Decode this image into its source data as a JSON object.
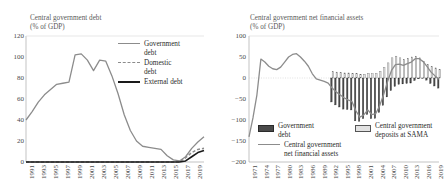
{
  "figure": {
    "panels": [
      "left",
      "right"
    ]
  },
  "chart_data": [
    {
      "id": "central-government-debt",
      "type": "line",
      "title": "Central government debt",
      "subtitle": "(% of GDP)",
      "xlabel": "",
      "ylabel": "",
      "ylim": [
        0,
        120
      ],
      "yticks": [
        0,
        20,
        40,
        60,
        80,
        100,
        120
      ],
      "xlim": [
        1990,
        2019
      ],
      "xticks": [
        1991,
        1993,
        1995,
        1997,
        1999,
        2001,
        2003,
        2005,
        2007,
        2009,
        2011,
        2013,
        2015,
        2017,
        2019
      ],
      "grid": false,
      "legend_position": "top-right",
      "x": [
        1990,
        1991,
        1992,
        1993,
        1994,
        1995,
        1996,
        1997,
        1998,
        1999,
        2000,
        2001,
        2002,
        2003,
        2004,
        2005,
        2006,
        2007,
        2008,
        2009,
        2010,
        2011,
        2012,
        2013,
        2014,
        2015,
        2016,
        2017,
        2018,
        2019
      ],
      "series": [
        {
          "name": "Government debt",
          "style": "solid",
          "color": "#8c8c8c",
          "values": [
            40,
            48,
            57,
            64,
            69,
            74,
            75,
            76,
            102,
            103,
            97,
            87,
            97,
            96,
            82,
            65,
            45,
            30,
            20,
            15,
            14,
            13,
            12,
            6,
            2,
            1,
            5,
            13,
            19,
            24
          ]
        },
        {
          "name": "Domestic debt",
          "style": "dashed",
          "color": "#8c8c8c",
          "values": [
            0,
            0,
            0,
            0,
            0,
            0,
            0,
            0,
            0,
            0,
            0,
            0,
            0,
            0,
            0,
            0,
            0,
            0,
            0,
            0,
            0,
            0,
            0,
            0,
            0,
            0,
            4,
            9,
            12,
            13
          ]
        },
        {
          "name": "External debt",
          "style": "solid",
          "color": "#1a1a1a",
          "values": [
            0,
            0,
            0,
            0,
            0,
            0,
            0,
            0,
            0,
            0,
            0,
            0,
            0,
            0,
            0,
            0,
            0,
            0,
            0,
            0,
            0,
            0,
            0,
            0,
            0,
            0,
            1,
            5,
            9,
            11
          ]
        }
      ]
    },
    {
      "id": "central-government-net-financial-assets",
      "type": "bar",
      "title": "Central government net financial assets",
      "subtitle": "(% of GDP)",
      "xlabel": "",
      "ylabel": "",
      "ylim": [
        -200,
        100
      ],
      "yticks": [
        100,
        50,
        0,
        -50,
        -100,
        -150,
        -200
      ],
      "xlim": [
        1971,
        2019
      ],
      "xticks": [
        1971,
        1974,
        1977,
        1980,
        1983,
        1986,
        1989,
        1992,
        1995,
        1998,
        2001,
        2004,
        2007,
        2010,
        2013,
        2016,
        2019
      ],
      "grid": false,
      "legend_position": "bottom",
      "x": [
        1971,
        1972,
        1973,
        1974,
        1975,
        1976,
        1977,
        1978,
        1979,
        1980,
        1981,
        1982,
        1983,
        1984,
        1985,
        1986,
        1987,
        1988,
        1989,
        1990,
        1991,
        1992,
        1993,
        1994,
        1995,
        1996,
        1997,
        1998,
        1999,
        2000,
        2001,
        2002,
        2003,
        2004,
        2005,
        2006,
        2007,
        2008,
        2009,
        2010,
        2011,
        2012,
        2013,
        2014,
        2015,
        2016,
        2017,
        2018,
        2019
      ],
      "series": [
        {
          "name": "Government debt",
          "kind": "bar",
          "color": "#4a4a4a",
          "values": [
            0,
            0,
            0,
            0,
            0,
            0,
            0,
            0,
            0,
            0,
            0,
            0,
            0,
            0,
            0,
            0,
            0,
            0,
            0,
            0,
            0,
            -57,
            -64,
            -69,
            -74,
            -75,
            -76,
            -102,
            -103,
            -97,
            -87,
            -97,
            -96,
            -82,
            -65,
            -45,
            -30,
            -20,
            -15,
            -14,
            -13,
            -12,
            -6,
            -2,
            -1,
            -5,
            -13,
            -19,
            -24
          ]
        },
        {
          "name": "Central government deposits at SAMA",
          "kind": "bar",
          "color": "#e2e2e2",
          "values": [
            0,
            0,
            0,
            0,
            0,
            0,
            0,
            0,
            0,
            0,
            0,
            0,
            0,
            0,
            0,
            0,
            0,
            0,
            0,
            0,
            0,
            15,
            14,
            13,
            12,
            12,
            11,
            10,
            9,
            9,
            11,
            10,
            11,
            16,
            25,
            36,
            48,
            52,
            48,
            44,
            47,
            50,
            52,
            48,
            40,
            32,
            27,
            24,
            20
          ]
        },
        {
          "name": "Central government net financial assets",
          "kind": "line",
          "color": "#8c8c8c",
          "values": [
            -140,
            -95,
            -40,
            45,
            38,
            28,
            22,
            20,
            26,
            38,
            50,
            56,
            58,
            50,
            40,
            28,
            10,
            -2,
            -5,
            -8,
            -12,
            -24,
            -33,
            -40,
            -47,
            -52,
            -56,
            -78,
            -93,
            -88,
            -76,
            -87,
            -85,
            -66,
            -40,
            -9,
            18,
            32,
            33,
            30,
            34,
            38,
            46,
            46,
            39,
            27,
            14,
            5,
            -3
          ]
        }
      ]
    }
  ],
  "left_chart": {
    "title": "Central government debt",
    "subtitle": "(% of GDP)",
    "yticks": [
      "120",
      "100",
      "80",
      "60",
      "40",
      "20",
      "0"
    ],
    "xticks": [
      "1991",
      "1993",
      "1995",
      "1997",
      "1999",
      "2001",
      "2003",
      "2005",
      "2007",
      "2009",
      "2011",
      "2013",
      "2015",
      "2017",
      "2019"
    ],
    "legend": [
      {
        "label": "Government\ndebt",
        "line1": "Government",
        "line2": "debt",
        "swatch": "line-gray"
      },
      {
        "label": "Domestic\ndebt",
        "line1": "Domestic",
        "line2": "debt",
        "swatch": "line-dash"
      },
      {
        "label": "External debt",
        "line1": "External debt",
        "line2": "",
        "swatch": "line-black"
      }
    ]
  },
  "right_chart": {
    "title": "Central government net financial assets",
    "subtitle": "(% of GDP)",
    "yticks": [
      "100",
      "50",
      "0",
      "−50",
      "−100",
      "−150",
      "−200"
    ],
    "xticks": [
      "1971",
      "1974",
      "1977",
      "1980",
      "1983",
      "1986",
      "1989",
      "1992",
      "1995",
      "1998",
      "2001",
      "2004",
      "2007",
      "2010",
      "2013",
      "2016",
      "2019"
    ],
    "legend": [
      {
        "line1": "Government",
        "line2": "debt",
        "swatch": "bar-dark"
      },
      {
        "line1": "Central government",
        "line2": "net financial assets",
        "swatch": "line-gray"
      },
      {
        "line1": "Central government",
        "line2": "deposits at SAMA",
        "swatch": "bar-light"
      }
    ]
  }
}
